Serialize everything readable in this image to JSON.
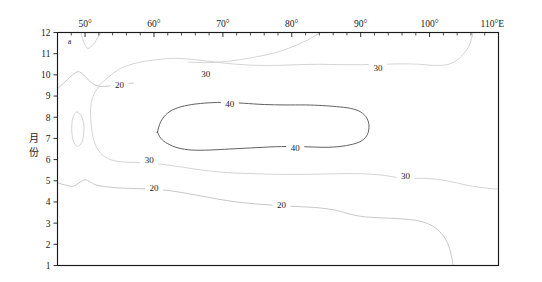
{
  "figure": {
    "panel_label": "a",
    "background_color": "#ffffff",
    "frame_color": "#1a1a1a"
  },
  "axes": {
    "x": {
      "position": "top",
      "title": "",
      "unit_suffix": "E",
      "range": [
        46,
        110
      ],
      "major_tick_values": [
        50,
        60,
        70,
        80,
        90,
        100,
        110
      ],
      "major_tick_labels": [
        "50°",
        "60°",
        "70°",
        "80°",
        "90°",
        "100°",
        "110°E"
      ],
      "minor_tick_step": 2
    },
    "y": {
      "position": "left",
      "title": "月份",
      "title_chars": [
        "月",
        "份"
      ],
      "range": [
        1,
        12
      ],
      "direction": "increasing-upward",
      "tick_values": [
        1,
        2,
        3,
        4,
        5,
        6,
        7,
        8,
        9,
        10,
        11,
        12
      ],
      "tick_labels": [
        "1",
        "2",
        "3",
        "4",
        "5",
        "6",
        "7",
        "8",
        "9",
        "10",
        "11",
        "12"
      ]
    }
  },
  "chart_data": {
    "type": "line",
    "title": "",
    "subtitle": "",
    "xlabel": "",
    "ylabel": "月份",
    "xlim": [
      46,
      110
    ],
    "ylim": [
      1,
      12
    ],
    "grid": false,
    "legend": "none",
    "plot_kind": "contour",
    "contour_levels": [
      20,
      30,
      40
    ],
    "level_colors": {
      "20": "#bdbdbd",
      "30": "#cccccc",
      "40": "#5a5a5a"
    },
    "annotations": [
      {
        "text": "a",
        "x": 47.5,
        "y": 11.6,
        "role": "panel-label"
      },
      {
        "text": "20",
        "x": 55.0,
        "y": 9.55,
        "role": "contour-label",
        "level": 20
      },
      {
        "text": "30",
        "x": 67.5,
        "y": 10.05,
        "role": "contour-label",
        "level": 30
      },
      {
        "text": "30",
        "x": 92.5,
        "y": 10.35,
        "role": "contour-label",
        "level": 30
      },
      {
        "text": "40",
        "x": 71.0,
        "y": 8.62,
        "role": "contour-label",
        "level": 40
      },
      {
        "text": "40",
        "x": 80.5,
        "y": 6.58,
        "role": "contour-label",
        "level": 40
      },
      {
        "text": "30",
        "x": 59.3,
        "y": 6.0,
        "role": "contour-label",
        "level": 30
      },
      {
        "text": "30",
        "x": 96.5,
        "y": 5.25,
        "role": "contour-label",
        "level": 30
      },
      {
        "text": "20",
        "x": 60.0,
        "y": 4.65,
        "role": "contour-label",
        "level": 20
      },
      {
        "text": "20",
        "x": 78.5,
        "y": 3.85,
        "role": "contour-label",
        "level": 20
      }
    ],
    "series": [
      {
        "name": "contour-20-upper",
        "level": 20,
        "points": [
          [
            46.0,
            9.35
          ],
          [
            47.2,
            9.7
          ],
          [
            48.2,
            10.0
          ],
          [
            49.0,
            10.15
          ],
          [
            49.8,
            10.0
          ],
          [
            50.6,
            9.72
          ],
          [
            51.6,
            9.5
          ],
          [
            52.8,
            9.45
          ],
          [
            54.0,
            9.5
          ],
          [
            55.6,
            9.56
          ],
          [
            57.0,
            9.62
          ]
        ]
      },
      {
        "name": "contour-20-lower",
        "level": 20,
        "points": [
          [
            46.0,
            4.9
          ],
          [
            47.4,
            4.78
          ],
          [
            48.3,
            4.74
          ],
          [
            49.2,
            4.92
          ],
          [
            50.0,
            5.05
          ],
          [
            50.7,
            4.95
          ],
          [
            51.6,
            4.8
          ],
          [
            53.0,
            4.72
          ],
          [
            55.0,
            4.66
          ],
          [
            57.5,
            4.63
          ],
          [
            60.2,
            4.6
          ],
          [
            63.0,
            4.5
          ],
          [
            66.0,
            4.33
          ],
          [
            69.0,
            4.15
          ],
          [
            72.0,
            4.0
          ],
          [
            75.0,
            3.9
          ],
          [
            78.0,
            3.83
          ],
          [
            81.0,
            3.78
          ],
          [
            84.0,
            3.72
          ],
          [
            86.5,
            3.6
          ],
          [
            88.5,
            3.42
          ],
          [
            90.5,
            3.3
          ],
          [
            93.0,
            3.25
          ],
          [
            96.0,
            3.2
          ],
          [
            98.5,
            3.1
          ],
          [
            100.5,
            2.85
          ],
          [
            102.0,
            2.4
          ],
          [
            102.8,
            1.9
          ],
          [
            103.2,
            1.4
          ],
          [
            103.4,
            1.0
          ]
        ]
      },
      {
        "name": "contour-30-upper",
        "level": 30,
        "points": [
          [
            52.0,
            9.5
          ],
          [
            53.4,
            9.9
          ],
          [
            54.6,
            10.2
          ],
          [
            56.0,
            10.42
          ],
          [
            58.0,
            10.6
          ],
          [
            60.5,
            10.72
          ],
          [
            63.0,
            10.78
          ],
          [
            66.0,
            10.72
          ],
          [
            69.0,
            10.6
          ],
          [
            72.0,
            10.5
          ],
          [
            75.0,
            10.45
          ],
          [
            78.0,
            10.45
          ],
          [
            81.0,
            10.48
          ],
          [
            84.0,
            10.5
          ],
          [
            87.0,
            10.48
          ],
          [
            90.0,
            10.48
          ],
          [
            93.0,
            10.5
          ],
          [
            96.0,
            10.52
          ],
          [
            98.5,
            10.5
          ],
          [
            100.5,
            10.45
          ],
          [
            102.5,
            10.48
          ],
          [
            104.0,
            10.7
          ],
          [
            105.2,
            11.1
          ],
          [
            105.9,
            11.5
          ],
          [
            106.3,
            12.0
          ]
        ]
      },
      {
        "name": "contour-30-branch-top",
        "level": 30,
        "points": [
          [
            84.2,
            12.0
          ],
          [
            82.0,
            11.6
          ],
          [
            79.5,
            11.25
          ],
          [
            77.0,
            11.0
          ],
          [
            74.0,
            10.8
          ],
          [
            71.0,
            10.65
          ],
          [
            68.0,
            10.58
          ],
          [
            65.0,
            10.6
          ]
        ]
      },
      {
        "name": "contour-30-lower",
        "level": 30,
        "points": [
          [
            52.0,
            9.45
          ],
          [
            51.3,
            9.1
          ],
          [
            50.9,
            8.7
          ],
          [
            50.8,
            8.2
          ],
          [
            50.9,
            7.6
          ],
          [
            51.2,
            7.0
          ],
          [
            51.8,
            6.5
          ],
          [
            52.8,
            6.15
          ],
          [
            54.2,
            5.95
          ],
          [
            56.0,
            5.88
          ],
          [
            58.5,
            5.85
          ],
          [
            61.0,
            5.78
          ],
          [
            64.0,
            5.65
          ],
          [
            67.0,
            5.5
          ],
          [
            70.0,
            5.4
          ],
          [
            73.0,
            5.35
          ],
          [
            76.0,
            5.32
          ],
          [
            79.0,
            5.3
          ],
          [
            82.0,
            5.3
          ],
          [
            85.0,
            5.32
          ],
          [
            88.0,
            5.34
          ],
          [
            91.0,
            5.32
          ],
          [
            93.5,
            5.25
          ],
          [
            95.5,
            5.15
          ],
          [
            97.5,
            5.12
          ],
          [
            100.0,
            5.1
          ],
          [
            102.5,
            5.0
          ],
          [
            105.0,
            4.82
          ],
          [
            107.5,
            4.68
          ],
          [
            110.0,
            4.6
          ]
        ]
      },
      {
        "name": "contour-40-closed",
        "level": 40,
        "closed": true,
        "points": [
          [
            60.5,
            7.3
          ],
          [
            61.0,
            7.8
          ],
          [
            62.0,
            8.2
          ],
          [
            63.5,
            8.45
          ],
          [
            65.5,
            8.6
          ],
          [
            68.0,
            8.68
          ],
          [
            70.5,
            8.7
          ],
          [
            73.0,
            8.66
          ],
          [
            76.0,
            8.6
          ],
          [
            79.0,
            8.58
          ],
          [
            82.0,
            8.58
          ],
          [
            84.5,
            8.55
          ],
          [
            86.5,
            8.5
          ],
          [
            88.5,
            8.42
          ],
          [
            90.0,
            8.25
          ],
          [
            90.9,
            7.95
          ],
          [
            91.2,
            7.6
          ],
          [
            91.0,
            7.2
          ],
          [
            90.2,
            6.9
          ],
          [
            88.8,
            6.72
          ],
          [
            87.0,
            6.62
          ],
          [
            85.0,
            6.58
          ],
          [
            82.5,
            6.6
          ],
          [
            80.0,
            6.62
          ],
          [
            77.0,
            6.6
          ],
          [
            74.0,
            6.55
          ],
          [
            71.0,
            6.5
          ],
          [
            68.0,
            6.45
          ],
          [
            65.5,
            6.45
          ],
          [
            63.5,
            6.55
          ],
          [
            62.0,
            6.75
          ],
          [
            61.0,
            7.0
          ],
          [
            60.5,
            7.3
          ]
        ]
      },
      {
        "name": "contour-small-oval-left",
        "level": 20,
        "closed": true,
        "points": [
          [
            48.8,
            8.25
          ],
          [
            49.4,
            8.1
          ],
          [
            49.8,
            7.7
          ],
          [
            49.8,
            7.2
          ],
          [
            49.5,
            6.8
          ],
          [
            48.9,
            6.62
          ],
          [
            48.4,
            6.8
          ],
          [
            48.1,
            7.2
          ],
          [
            48.1,
            7.75
          ],
          [
            48.4,
            8.12
          ],
          [
            48.8,
            8.25
          ]
        ]
      },
      {
        "name": "contour-small-v-top",
        "level": 20,
        "points": [
          [
            49.4,
            12.0
          ],
          [
            49.8,
            11.55
          ],
          [
            50.4,
            11.25
          ],
          [
            51.2,
            11.45
          ],
          [
            51.9,
            11.8
          ],
          [
            52.3,
            12.0
          ]
        ]
      }
    ]
  }
}
